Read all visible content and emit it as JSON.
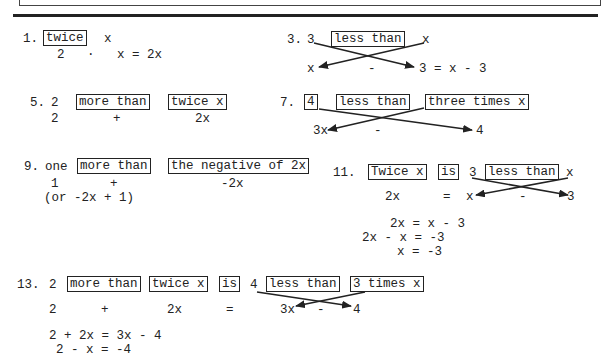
{
  "problems": {
    "p1": {
      "num": "1.",
      "box1": "twice",
      "w1": "x",
      "eq": "2   ·   x = 2x"
    },
    "p3": {
      "num": "3.",
      "a": "3",
      "box1": "less than",
      "b": "x",
      "l_x": "x",
      "l_minus": "-",
      "l_rest": "3 = x - 3"
    },
    "p5": {
      "num": "5.",
      "a": "2",
      "box1": "more than",
      "box2": "twice x",
      "l_2": "2",
      "l_plus": "+",
      "l_2x": "2x"
    },
    "p7": {
      "num": "7.",
      "box0": "4",
      "box1": "less than",
      "box2": "three times x",
      "l_3x": "3x",
      "l_minus": "-",
      "l_4": "4"
    },
    "p9": {
      "num": "9.",
      "a": "one",
      "box1": "more than",
      "box2": "the negative of 2x",
      "l_1": "1",
      "l_plus": "+",
      "l_neg2x": "-2x",
      "alt": "(or -2x + 1)"
    },
    "p11": {
      "num": "11.",
      "box1": "Twice x",
      "box2": "is",
      "a": "3",
      "box3": "less than",
      "b": "x",
      "l_2x": "2x",
      "l_eq": "=",
      "l_x": "x",
      "l_minus": "-",
      "l_3": "3",
      "s1": "2x = x - 3",
      "s2": "2x - x = -3",
      "s3": "x = -3"
    },
    "p13": {
      "num": "13.",
      "a": "2",
      "box1": "more than",
      "box2": "twice x",
      "box3": "is",
      "b": "4",
      "box4": "less than",
      "box5": "3 times x",
      "l_2": "2",
      "l_plus": "+",
      "l_2x": "2x",
      "l_eq": "=",
      "l_3x": "3x",
      "l_minus": "-",
      "l_4": "4",
      "s1": "2 + 2x = 3x - 4",
      "s2": "2 - x = -4"
    }
  }
}
